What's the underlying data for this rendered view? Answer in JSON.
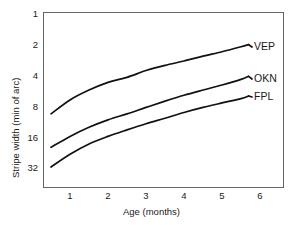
{
  "chart_data": {
    "type": "line",
    "title": "",
    "xlabel": "Age (months)",
    "ylabel": "Stripe width (min of arc)",
    "xlim": [
      0.3,
      6.55
    ],
    "ylim": [
      1,
      38
    ],
    "yscale": "log2-inverted",
    "grid": false,
    "legend_position": "right-inline",
    "xticks": [
      1,
      2,
      3,
      4,
      5,
      6
    ],
    "xtick_labels": [
      "1",
      "2",
      "3",
      "4",
      "5",
      "6"
    ],
    "yticks": [
      1,
      2,
      4,
      8,
      16,
      32
    ],
    "ytick_labels": [
      "1",
      "2",
      "4",
      "8",
      "16",
      "32"
    ],
    "x": [
      0.5,
      1,
      1.5,
      2,
      2.5,
      3,
      3.5,
      4,
      4.5,
      5,
      5.5,
      5.7
    ],
    "series": [
      {
        "name": "VEP",
        "label": "VEP",
        "color": "#111111",
        "values": [
          9.6,
          7.0,
          5.6,
          4.7,
          4.2,
          3.6,
          3.2,
          2.9,
          2.6,
          2.35,
          2.1,
          2.0
        ]
      },
      {
        "name": "OKN",
        "label": "OKN",
        "color": "#111111",
        "values": [
          20.5,
          16.0,
          13.0,
          11.0,
          9.6,
          8.3,
          7.2,
          6.3,
          5.6,
          5.0,
          4.4,
          4.1
        ]
      },
      {
        "name": "FPL",
        "label": "FPL",
        "color": "#111111",
        "values": [
          32.0,
          24.0,
          19.0,
          16.0,
          13.8,
          12.0,
          10.6,
          9.3,
          8.3,
          7.5,
          6.8,
          6.4
        ]
      }
    ]
  },
  "axes": {
    "frame_color": "#555555",
    "line_color": "#111111"
  }
}
